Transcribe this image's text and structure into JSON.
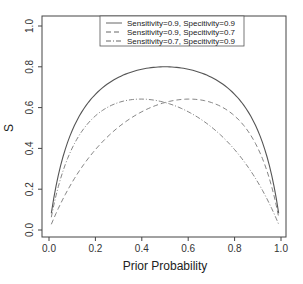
{
  "chart_data": {
    "type": "line",
    "title": "",
    "xlabel": "Prior Probability",
    "ylabel": "S",
    "xlim": [
      0,
      1
    ],
    "ylim": [
      0,
      1
    ],
    "x_ticks": [
      "0.0",
      "0.2",
      "0.4",
      "0.6",
      "0.8",
      "1.0"
    ],
    "y_ticks": [
      "0.0",
      "0.2",
      "0.4",
      "0.6",
      "0.8",
      "1.0"
    ],
    "grid": false,
    "legend_position": "top-center",
    "x": [
      0.01,
      0.05,
      0.1,
      0.2,
      0.3,
      0.4,
      0.5,
      0.6,
      0.7,
      0.8,
      0.9,
      0.95,
      0.99
    ],
    "series": [
      {
        "name": "Sensitivity=0.9, Specitivity=0.9",
        "style": "solid",
        "values": [
          0.082,
          0.316,
          0.488,
          0.665,
          0.749,
          0.788,
          0.8,
          0.788,
          0.749,
          0.665,
          0.488,
          0.316,
          0.082
        ]
      },
      {
        "name": "Sensitivity=0.9, Specitivity=0.7",
        "style": "dashed",
        "values": [
          0.028,
          0.129,
          0.234,
          0.394,
          0.505,
          0.58,
          0.625,
          0.642,
          0.625,
          0.559,
          0.402,
          0.252,
          0.063
        ]
      },
      {
        "name": "Sensitivity=0.7, Specitivity=0.9",
        "style": "dashdot",
        "values": [
          0.063,
          0.252,
          0.402,
          0.559,
          0.625,
          0.642,
          0.625,
          0.58,
          0.505,
          0.394,
          0.234,
          0.129,
          0.028
        ]
      }
    ]
  }
}
